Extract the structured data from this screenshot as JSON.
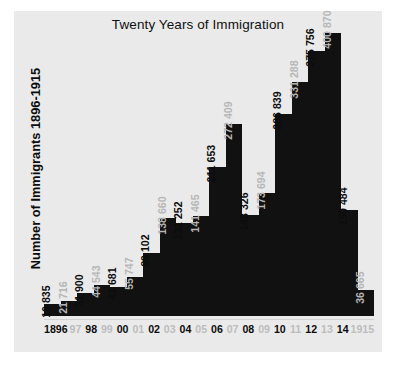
{
  "chart_data": {
    "type": "bar",
    "title": "Twenty Years of Immigration",
    "xlabel": "",
    "ylabel": "Number of Immigrants 1896-1915",
    "ylim": [
      0,
      400870
    ],
    "grid": false,
    "legend": "none",
    "categories": [
      "1896",
      "97",
      "98",
      "99",
      "00",
      "01",
      "02",
      "03",
      "04",
      "05",
      "06",
      "07",
      "08",
      "09",
      "10",
      "11",
      "12",
      "13",
      "14",
      "1915"
    ],
    "tick_labels": [
      "1896",
      "97",
      "98",
      "99",
      "00",
      "01",
      "02",
      "03",
      "04",
      "05",
      "06",
      "07",
      "08",
      "09",
      "10",
      "11",
      "12",
      "13",
      "14",
      "1915"
    ],
    "values": [
      16835,
      21716,
      31900,
      44543,
      41681,
      55747,
      89102,
      138660,
      131252,
      141465,
      211653,
      272409,
      143326,
      173694,
      286839,
      331288,
      375756,
      400870,
      150484,
      36665
    ],
    "value_labels": [
      "16 835",
      "21 716",
      "31 900",
      "44 543",
      "41 681",
      "55 747",
      "89 102",
      "138 660",
      "131 252",
      "141 465",
      "211 653",
      "272 409",
      "143 326",
      "173 694",
      "286 839",
      "331 288",
      "375 756",
      "400 870",
      "150 484",
      "36 665"
    ],
    "label_emphasis": [
      "dark",
      "light",
      "dark",
      "light",
      "dark",
      "light",
      "dark",
      "light",
      "dark",
      "light",
      "dark",
      "light",
      "dark",
      "light",
      "dark",
      "light",
      "dark",
      "light",
      "dark",
      "light"
    ],
    "bar_color": "#111111",
    "plot_background": "#eaeaea",
    "page_background": "#ffffff",
    "label_dark_color": "#0c0c0c",
    "label_light_color": "#b6b6b6"
  }
}
